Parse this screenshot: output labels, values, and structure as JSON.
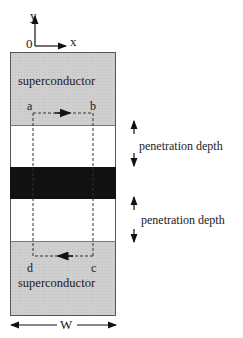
{
  "axes": {
    "y_label": "y",
    "x_label": "x",
    "origin_label": "0"
  },
  "regions": {
    "top": {
      "label": "superconductor",
      "color": "#cfcfcf"
    },
    "normal_top": {
      "label": "",
      "color": "#ffffff"
    },
    "barrier": {
      "label": "",
      "color": "#111111"
    },
    "normal_bottom": {
      "label": "",
      "color": "#ffffff"
    },
    "bottom": {
      "label": "superconductor",
      "color": "#cfcfcf"
    }
  },
  "loop": {
    "corners": [
      "a",
      "b",
      "c",
      "d"
    ]
  },
  "annotations": {
    "penetration_top": "penetration depth",
    "penetration_bottom": "penetration depth",
    "width_label": "W"
  }
}
